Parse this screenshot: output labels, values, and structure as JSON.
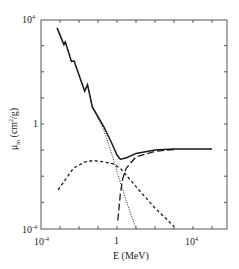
{
  "chart_data": {
    "type": "line",
    "title": "",
    "xlabel": "E (MeV)",
    "ylabel": "μm (cm²/g)",
    "xscale": "log",
    "yscale": "log",
    "xlim": [
      0.0001,
      600000
    ],
    "ylim": [
      0.0001,
      10000
    ],
    "x_ticks": [
      "10^-4",
      "1",
      "10^4"
    ],
    "y_ticks": [
      "10^-4",
      "1",
      "10^4"
    ],
    "grid": false,
    "legend": null,
    "series": [
      {
        "name": "Total",
        "style": "solid",
        "points": [
          [
            0.0007,
            4800
          ],
          [
            0.0016,
            1100
          ],
          [
            0.0019,
            1400
          ],
          [
            0.004,
            250
          ],
          [
            0.0055,
            260
          ],
          [
            0.02,
            18
          ],
          [
            0.028,
            32
          ],
          [
            0.05,
            4.5
          ],
          [
            0.2,
            0.8
          ],
          [
            0.5,
            0.2
          ],
          [
            1,
            0.065
          ],
          [
            1.5,
            0.045
          ],
          [
            3,
            0.05
          ],
          [
            10,
            0.075
          ],
          [
            100,
            0.1
          ],
          [
            1000,
            0.11
          ],
          [
            10000,
            0.11
          ],
          [
            100000,
            0.11
          ]
        ]
      },
      {
        "name": "Photoelectric",
        "style": "dotted",
        "points": [
          [
            0.0007,
            4800
          ],
          [
            0.0016,
            1100
          ],
          [
            0.0019,
            1400
          ],
          [
            0.004,
            250
          ],
          [
            0.0055,
            260
          ],
          [
            0.02,
            18
          ],
          [
            0.028,
            32
          ],
          [
            0.05,
            4.5
          ],
          [
            0.2,
            0.6
          ],
          [
            0.5,
            0.08
          ],
          [
            1,
            0.015
          ],
          [
            2,
            0.003
          ],
          [
            5,
            0.0004
          ],
          [
            10,
            0.0001
          ]
        ]
      },
      {
        "name": "Compton",
        "style": "short-dash",
        "points": [
          [
            0.0008,
            0.003
          ],
          [
            0.005,
            0.02
          ],
          [
            0.02,
            0.035
          ],
          [
            0.06,
            0.04
          ],
          [
            0.2,
            0.035
          ],
          [
            0.6,
            0.03
          ],
          [
            1.5,
            0.02
          ],
          [
            10,
            0.004
          ],
          [
            100,
            0.0006
          ],
          [
            1000,
            0.00012
          ]
        ]
      },
      {
        "name": "Pair production",
        "style": "long-dash",
        "points": [
          [
            1.1,
            0.0002
          ],
          [
            1.5,
            0.002
          ],
          [
            2,
            0.008
          ],
          [
            3,
            0.02
          ],
          [
            10,
            0.055
          ],
          [
            100,
            0.09
          ],
          [
            1000,
            0.105
          ]
        ]
      }
    ]
  },
  "axes": {
    "x_tick_labels": [
      {
        "base": "10",
        "exp": "-4"
      },
      {
        "base": "1",
        "exp": ""
      },
      {
        "base": "10",
        "exp": "4"
      }
    ],
    "y_tick_labels": [
      {
        "base": "10",
        "exp": "4"
      },
      {
        "base": "1",
        "exp": ""
      },
      {
        "base": "10",
        "exp": "-4"
      }
    ],
    "xlabel": "E (MeV)",
    "ylabel": {
      "mu": "μ",
      "sub": "m",
      "unit_pre": " (cm",
      "unit_exp": "2",
      "unit_post": "/g)"
    }
  },
  "colors": {
    "line": "#1a1a1a",
    "axis": "#555555"
  }
}
